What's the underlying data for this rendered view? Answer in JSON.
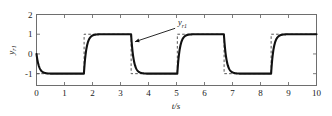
{
  "chart_data": {
    "type": "line",
    "title": "",
    "xlabel": "t/s",
    "ylabel": "y_r1",
    "xlim": [
      0,
      10
    ],
    "ylim": [
      -1.6,
      2
    ],
    "grid": false,
    "legend": "none",
    "x_ticks": [
      "0",
      "1",
      "2",
      "3",
      "4",
      "5",
      "6",
      "7",
      "8",
      "9",
      "10"
    ],
    "x_tick_values": [
      0,
      1,
      2,
      3,
      4,
      5,
      6,
      7,
      8,
      9,
      10
    ],
    "y_ticks": [
      "2",
      "1",
      "0",
      "-1"
    ],
    "y_tick_values": [
      2,
      1,
      0,
      -1
    ],
    "annotations": [
      {
        "text": "y",
        "subscript": "r1",
        "label_x": 5.05,
        "label_y": 1.45,
        "arrow_from_x": 4.95,
        "arrow_from_y": 1.3,
        "arrow_to_x": 3.52,
        "arrow_to_y": 0.62
      }
    ],
    "series": [
      {
        "name": "reference",
        "style": "dashed",
        "color": "#555555",
        "description": "Square-wave reference signal alternating between -1 and 1 with period 3.35 s",
        "waveform": "square",
        "amplitude": 1,
        "low_value": -1,
        "high_value": 1,
        "initial_value": -1,
        "transition_times": [
          1.7,
          3.38,
          5.03,
          6.7,
          8.38
        ],
        "transition_directions": [
          "up",
          "down",
          "up",
          "down",
          "up"
        ]
      },
      {
        "name": "output",
        "style": "solid",
        "color": "#111111",
        "description": "First-order lagged tracking response starting from 0, settling on each reference level",
        "start_value": 0,
        "time_constant": 0.09,
        "low_value": -1,
        "high_value": 1,
        "transition_times": [
          1.7,
          3.38,
          5.03,
          6.7,
          8.38
        ]
      }
    ]
  }
}
